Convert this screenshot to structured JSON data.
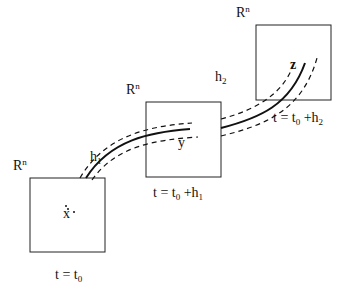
{
  "diagram": {
    "boxes": [
      {
        "space_label": "R",
        "space_sup": "n",
        "point": "x",
        "time_label": "t = t",
        "time_sub": "0",
        "time_suffix": ""
      },
      {
        "space_label": "R",
        "space_sup": "n",
        "point": "y",
        "time_label": "t = t",
        "time_sub": "0",
        "time_suffix": " +h",
        "time_suffix_sub": "1"
      },
      {
        "space_label": "R",
        "space_sup": "n",
        "point": "z",
        "time_label": "t = t",
        "time_sub": "0",
        "time_suffix": " +h",
        "time_suffix_sub": "2"
      }
    ],
    "steps": [
      {
        "label": "h",
        "sub": "1"
      },
      {
        "label": "h",
        "sub": "2"
      }
    ],
    "colors": {
      "stroke": "#1a1a1a",
      "background": "#ffffff"
    }
  }
}
